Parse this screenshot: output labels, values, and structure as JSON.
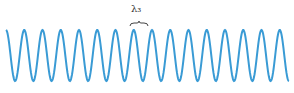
{
  "diagram": {
    "type": "sine-wave",
    "wave_color": "#3a9bd5",
    "label": "λ₃",
    "label_color": "#333333",
    "wave": {
      "x_start": 6,
      "x_end": 289,
      "y_top": 30,
      "y_bottom": 81,
      "period_px": 18.25,
      "start_phase": "crest"
    },
    "brace": {
      "x1": 130,
      "x2": 148,
      "y": 23
    }
  }
}
